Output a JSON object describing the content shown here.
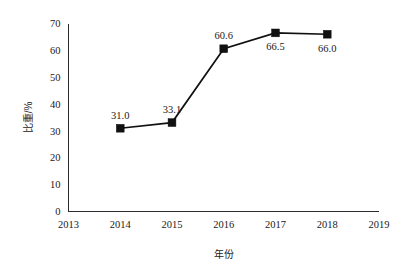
{
  "chart_data": {
    "type": "line",
    "title": "",
    "subtitle": "",
    "xlabel": "年份",
    "ylabel": "比重/%",
    "categories": [
      2014,
      2015,
      2016,
      2017,
      2018
    ],
    "x": [
      2014,
      2015,
      2016,
      2017,
      2018
    ],
    "values": [
      31.0,
      33.1,
      60.6,
      66.5,
      66.0
    ],
    "point_labels": [
      "31.0",
      "33.1",
      "60.6",
      "66.5",
      "66.0"
    ],
    "point_label_positions": [
      "above",
      "above",
      "above",
      "below",
      "below"
    ],
    "series": [
      {
        "name": "比重/%",
        "values": [
          31.0,
          33.1,
          60.6,
          66.5,
          66.0
        ],
        "color": "#111111",
        "marker": "filled-square"
      }
    ],
    "xlim": [
      2013,
      2019
    ],
    "ylim": [
      0,
      70
    ],
    "x_ticks": [
      2013,
      2014,
      2015,
      2016,
      2017,
      2018,
      2019
    ],
    "x_tick_labels": [
      "2013",
      "2014",
      "2015",
      "2016",
      "2017",
      "2018",
      "2019"
    ],
    "y_ticks": [
      0,
      10,
      20,
      30,
      40,
      50,
      60,
      70
    ],
    "y_tick_labels": [
      "0",
      "10",
      "20",
      "30",
      "40",
      "50",
      "60",
      "70"
    ],
    "grid": false,
    "legend": false,
    "legend_position": "none",
    "background_color": "#ffffff",
    "axis_color": "#2b2b2b"
  },
  "axes": {
    "y_title": "比重/%",
    "x_title": "年份"
  },
  "ticks": {
    "y": [
      "0",
      "10",
      "20",
      "30",
      "40",
      "50",
      "60",
      "70"
    ],
    "x": [
      "2013",
      "2014",
      "2015",
      "2016",
      "2017",
      "2018",
      "2019"
    ]
  },
  "labels": {
    "p0": "31.0",
    "p1": "33.1",
    "p2": "60.6",
    "p3": "66.5",
    "p4": "66.0"
  }
}
